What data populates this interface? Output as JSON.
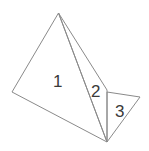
{
  "diagram": {
    "triangles": [
      {
        "label": "1"
      },
      {
        "label": "2"
      },
      {
        "label": "3"
      }
    ],
    "colors": {
      "stroke": "#8a8a8a",
      "text": "#3a3a3a",
      "background": "#ffffff"
    }
  }
}
